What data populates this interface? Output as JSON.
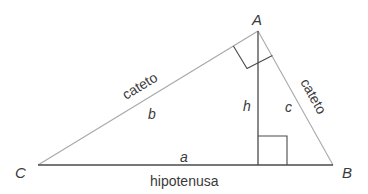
{
  "diagram": {
    "vertices": {
      "A": {
        "label": "A",
        "x": 258,
        "y": 31
      },
      "B": {
        "label": "B",
        "x": 333,
        "y": 165
      },
      "C": {
        "label": "C",
        "x": 38,
        "y": 165
      },
      "H": {
        "x": 258,
        "y": 165
      }
    },
    "sides": {
      "a": {
        "label": "a",
        "name": "hipotenusa"
      },
      "b": {
        "label": "b",
        "name": "cateto"
      },
      "c": {
        "label": "c",
        "name": "cateto"
      },
      "h": {
        "label": "h"
      }
    },
    "colors": {
      "sides": "#a8a8a8",
      "hypotenuse_and_height": "#4a4a4a",
      "text": "#3a3a3a"
    }
  }
}
